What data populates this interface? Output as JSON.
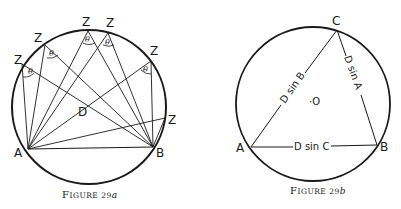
{
  "figure_a": {
    "caption": "Figure 29a",
    "caption_small": "IGURE 29",
    "caption_F": "F",
    "caption_suffix": "a",
    "labels": {
      "A": "A",
      "B": "B",
      "D": "D",
      "Z": "Z",
      "theta": "θ"
    }
  },
  "figure_b": {
    "caption": "Figure 29b",
    "caption_F": "F",
    "caption_small": "IGURE 29",
    "caption_suffix": "b",
    "labels": {
      "A": "A",
      "B": "B",
      "C": "C",
      "O": "·O",
      "side_AC": "D sin B",
      "side_CB": "D sin A",
      "side_AB": "D sin C"
    }
  },
  "colors": {
    "ink": "#1a1a1a",
    "background": "#ffffff"
  }
}
